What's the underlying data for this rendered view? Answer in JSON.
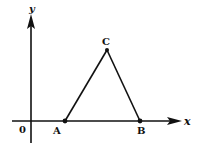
{
  "diagram": {
    "type": "coordinate-geometry",
    "axes": {
      "x_label": "x",
      "y_label": "y",
      "origin_label": "0"
    },
    "points": [
      {
        "name": "A",
        "label": "A",
        "px": [
          65,
          121
        ]
      },
      {
        "name": "B",
        "label": "B",
        "px": [
          140,
          121
        ]
      },
      {
        "name": "C",
        "label": "C",
        "px": [
          107,
          50
        ]
      }
    ],
    "segments": [
      [
        "A",
        "C"
      ],
      [
        "C",
        "B"
      ],
      [
        "A",
        "B"
      ]
    ],
    "colors": {
      "stroke": "#111111",
      "background": "#ffffff"
    }
  }
}
